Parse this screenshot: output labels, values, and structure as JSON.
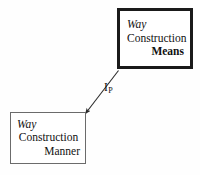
{
  "diagram": {
    "type": "node-link-diagram",
    "background_color": "#fefefe",
    "text_color": "#111111",
    "nodes": [
      {
        "id": "means",
        "name": "way-construction-means",
        "lines": [
          {
            "text": "Way",
            "style": "italic",
            "align": "left"
          },
          {
            "text": "Construction",
            "style": "plain",
            "align": "center"
          },
          {
            "text": "Means",
            "style": "bold",
            "align": "right"
          }
        ],
        "border_color": "#1a1a1a",
        "border_width": "3px",
        "fill": "#ffffff"
      },
      {
        "id": "manner",
        "name": "way-construction-manner",
        "lines": [
          {
            "text": "Way",
            "style": "italic",
            "align": "left"
          },
          {
            "text": "Construction",
            "style": "plain",
            "align": "center"
          },
          {
            "text": "Manner",
            "style": "plain",
            "align": "right"
          }
        ],
        "border_color": "#6b6b6b",
        "border_width": "1px",
        "fill": "#ffffff"
      }
    ],
    "edges": [
      {
        "id": "inheritance-edge",
        "from": "means",
        "to": "manner",
        "label_base": "I",
        "label_sub": "P",
        "arrowhead": "filled-triangle",
        "line_color": "#2b2b2b"
      }
    ]
  }
}
